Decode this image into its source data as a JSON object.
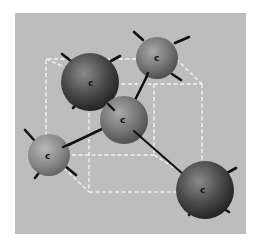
{
  "diagram": {
    "background_color": "#bdbdbd",
    "cube_line_color": "#f2f2f2",
    "bond_color": "#111111",
    "atoms": [
      {
        "id": "top-left-large",
        "label": "c",
        "cx": 90,
        "cy": 82,
        "r": 29,
        "shade": "dark"
      },
      {
        "id": "top-right",
        "label": "c",
        "cx": 157,
        "cy": 58,
        "r": 21,
        "shade": "medium"
      },
      {
        "id": "center",
        "label": "c",
        "cx": 124,
        "cy": 120,
        "r": 24,
        "shade": "medium"
      },
      {
        "id": "left",
        "label": "c",
        "cx": 49,
        "cy": 155,
        "r": 21,
        "shade": "light"
      },
      {
        "id": "bottom-right-large",
        "label": "c",
        "cx": 205,
        "cy": 190,
        "r": 29,
        "shade": "dark"
      }
    ],
    "bonds": [
      {
        "from": "center",
        "to": "top-right"
      },
      {
        "from": "center",
        "to": "left"
      },
      {
        "from": "center",
        "to": "bottom-right-large"
      },
      {
        "from": "center",
        "to": "top-left-large"
      }
    ]
  }
}
